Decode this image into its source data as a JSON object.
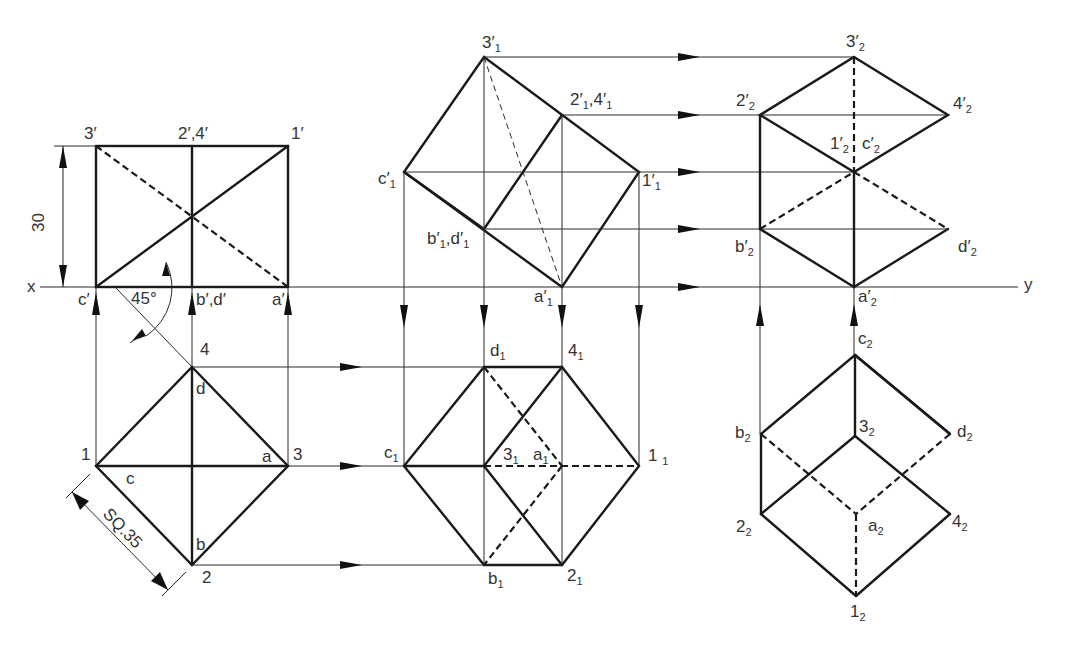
{
  "axis": {
    "x_label": "x",
    "y_label": "y"
  },
  "dimensions": {
    "height": "30",
    "square_side": "SQ.35",
    "angle": "45°"
  },
  "views": {
    "initial_front": {
      "labels": {
        "p3": "3′",
        "p24": "2′,4′",
        "p1": "1′",
        "c": "c′",
        "bd": "b′,d′",
        "a": "a′"
      }
    },
    "initial_top": {
      "labels": {
        "p4": "4",
        "d": "d",
        "p1": "1",
        "c": "c",
        "a": "a",
        "p3": "3",
        "b": "b",
        "p2": "2"
      }
    },
    "tilted_front": {
      "labels": {
        "p3": {
          "main": "3′",
          "sub": "1"
        },
        "p24": {
          "main": "2′",
          "sub": "1",
          "main2": ",4′",
          "sub2": "1"
        },
        "c": {
          "main": "c′",
          "sub": "1"
        },
        "p1": {
          "main": "1′",
          "sub": "1"
        },
        "bd": {
          "main": "b′",
          "sub": "1",
          "main2": ",d′",
          "sub2": "1"
        },
        "a": {
          "main": "a′",
          "sub": "1"
        }
      }
    },
    "tilted_top": {
      "labels": {
        "d": {
          "main": "d",
          "sub": "1"
        },
        "p4": {
          "main": "4",
          "sub": "1"
        },
        "c": {
          "main": "c",
          "sub": "1"
        },
        "p3": {
          "main": "3",
          "sub": "1"
        },
        "a": {
          "main": "a",
          "sub": "1"
        },
        "p1": {
          "main": "1 ",
          "sub": "1"
        },
        "b": {
          "main": "b",
          "sub": "1"
        },
        "p2": {
          "main": "2",
          "sub": "1"
        }
      }
    },
    "final_front": {
      "labels": {
        "p3": {
          "main": "3′",
          "sub": "2"
        },
        "p2": {
          "main": "2′",
          "sub": "2"
        },
        "p4": {
          "main": "4′",
          "sub": "2"
        },
        "p1": {
          "main": "1′",
          "sub": "2"
        },
        "c": {
          "main": "c′",
          "sub": "2"
        },
        "b": {
          "main": "b′",
          "sub": "2"
        },
        "d": {
          "main": "d′",
          "sub": "2"
        },
        "a": {
          "main": "a′",
          "sub": "2"
        }
      }
    },
    "final_top": {
      "labels": {
        "c": {
          "main": "c",
          "sub": "2"
        },
        "b": {
          "main": "b",
          "sub": "2"
        },
        "p3": {
          "main": "3",
          "sub": "2"
        },
        "d": {
          "main": "d",
          "sub": "2"
        },
        "p2": {
          "main": "2",
          "sub": "2"
        },
        "a": {
          "main": "a",
          "sub": "2"
        },
        "p4": {
          "main": "4",
          "sub": "2"
        },
        "p1": {
          "main": "1",
          "sub": "2"
        }
      }
    }
  },
  "colors": {
    "line": "#1a1a1a",
    "text": "#333333",
    "background": "#ffffff"
  }
}
